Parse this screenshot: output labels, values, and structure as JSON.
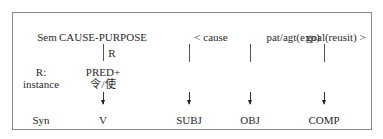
{
  "rows": {
    "sem_label": "Sem",
    "r_label_1": "R:",
    "r_label_2": "instance",
    "syn_label": "Syn"
  },
  "sem": {
    "predicate": "CAUSE-PURPOSE",
    "relation_label": "R",
    "args": [
      "< cause",
      "pat/agt(exp)",
      "goal(reusit) >"
    ]
  },
  "instance": {
    "line1": "PRED+",
    "line2": "令/使"
  },
  "syn": [
    "V",
    "SUBJ",
    "OBJ",
    "COMP"
  ]
}
